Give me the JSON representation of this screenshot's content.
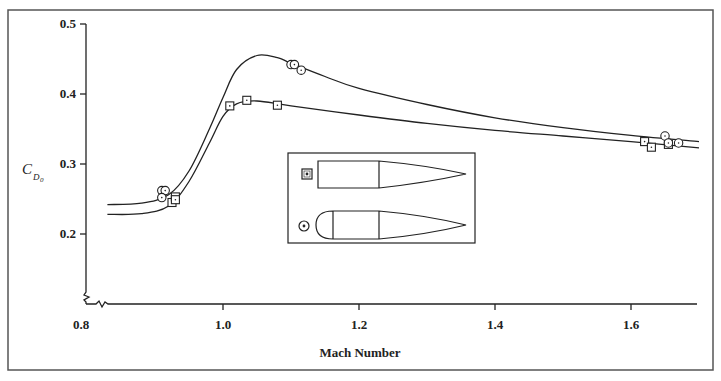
{
  "chart_data": {
    "type": "scatter",
    "title": "",
    "xlabel": "Mach Number",
    "ylabel": "C_D0",
    "ylabel_main": "C",
    "ylabel_sub": "D",
    "ylabel_subsub": "0",
    "xlim": [
      0.8,
      1.7
    ],
    "ylim": [
      0.2,
      0.5
    ],
    "x_ticks": [
      0.8,
      1.0,
      1.2,
      1.4,
      1.6
    ],
    "x_tick_labels": [
      "0.8",
      "1.0",
      "1.2",
      "1.4",
      "1.6"
    ],
    "y_ticks": [
      0.2,
      0.3,
      0.4,
      0.5
    ],
    "y_tick_labels": [
      "0.2",
      "0.3",
      "0.4",
      "0.5"
    ],
    "axis_break": "both axes broken near origin (zigzag)",
    "grid": false,
    "legend": {
      "position": "inset box, center",
      "entries": [
        {
          "marker": "square",
          "label": "pointed ogive nose + cylinder body"
        },
        {
          "marker": "circle",
          "label": "blunt rounded nose + cylinder body"
        }
      ]
    },
    "series": [
      {
        "name": "square (pointed nose)",
        "marker": "square",
        "points": [
          {
            "x": 0.925,
            "y": 0.245
          },
          {
            "x": 0.93,
            "y": 0.253
          },
          {
            "x": 0.93,
            "y": 0.249
          },
          {
            "x": 1.01,
            "y": 0.383
          },
          {
            "x": 1.035,
            "y": 0.391
          },
          {
            "x": 1.08,
            "y": 0.384
          },
          {
            "x": 1.62,
            "y": 0.332
          },
          {
            "x": 1.63,
            "y": 0.324
          },
          {
            "x": 1.655,
            "y": 0.328
          }
        ],
        "fit_curve": [
          [
            0.83,
            0.228
          ],
          [
            0.88,
            0.229
          ],
          [
            0.92,
            0.24
          ],
          [
            0.95,
            0.275
          ],
          [
            0.98,
            0.33
          ],
          [
            1.0,
            0.368
          ],
          [
            1.02,
            0.386
          ],
          [
            1.05,
            0.39
          ],
          [
            1.1,
            0.383
          ],
          [
            1.2,
            0.37
          ],
          [
            1.3,
            0.358
          ],
          [
            1.4,
            0.348
          ],
          [
            1.5,
            0.34
          ],
          [
            1.6,
            0.332
          ],
          [
            1.7,
            0.323
          ]
        ]
      },
      {
        "name": "circle (rounded nose)",
        "marker": "circle",
        "points": [
          {
            "x": 0.91,
            "y": 0.262
          },
          {
            "x": 0.915,
            "y": 0.262
          },
          {
            "x": 0.91,
            "y": 0.252
          },
          {
            "x": 1.1,
            "y": 0.442
          },
          {
            "x": 1.105,
            "y": 0.442
          },
          {
            "x": 1.115,
            "y": 0.434
          },
          {
            "x": 1.65,
            "y": 0.34
          },
          {
            "x": 1.655,
            "y": 0.33
          },
          {
            "x": 1.67,
            "y": 0.33
          }
        ],
        "fit_curve": [
          [
            0.83,
            0.242
          ],
          [
            0.88,
            0.244
          ],
          [
            0.92,
            0.256
          ],
          [
            0.95,
            0.29
          ],
          [
            0.98,
            0.35
          ],
          [
            1.0,
            0.395
          ],
          [
            1.02,
            0.435
          ],
          [
            1.05,
            0.455
          ],
          [
            1.08,
            0.452
          ],
          [
            1.1,
            0.444
          ],
          [
            1.15,
            0.425
          ],
          [
            1.2,
            0.408
          ],
          [
            1.3,
            0.385
          ],
          [
            1.4,
            0.366
          ],
          [
            1.5,
            0.352
          ],
          [
            1.6,
            0.341
          ],
          [
            1.7,
            0.332
          ]
        ]
      }
    ]
  }
}
